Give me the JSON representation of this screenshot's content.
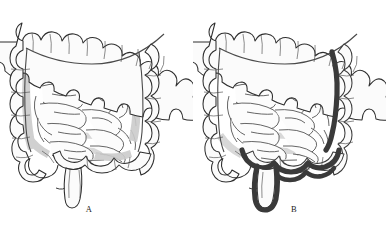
{
  "figure": {
    "background_color": "#ffffff",
    "type": "medical-anatomical-illustration",
    "panel_count": 2
  },
  "panels": [
    {
      "id": "A",
      "caption": "A",
      "description": "normal colon, no highlighted segment",
      "highlight": false
    },
    {
      "id": "B",
      "caption": "B",
      "description": "colon with descending colon, sigmoid colon and rectum outlined in bold dark ink",
      "highlight": true,
      "highlighted_segments": [
        "descending colon",
        "sigmoid colon",
        "rectum"
      ]
    }
  ],
  "colors": {
    "outline": "#2e2e2e",
    "fine_line": "#4a4a4a",
    "shading_gray": "#c9c9c9",
    "shading_gray_light": "#dedede",
    "highlight_dark": "#3a3a3a",
    "fill": "#fbfbfb",
    "caption_text": "#1b1b1b",
    "background": "#ffffff"
  },
  "anatomy": {
    "parts": [
      "transverse colon",
      "hepatic flexure",
      "splenic flexure",
      "ascending colon",
      "descending colon",
      "cecum",
      "appendix",
      "sigmoid colon",
      "rectum",
      "small intestine loops"
    ]
  }
}
